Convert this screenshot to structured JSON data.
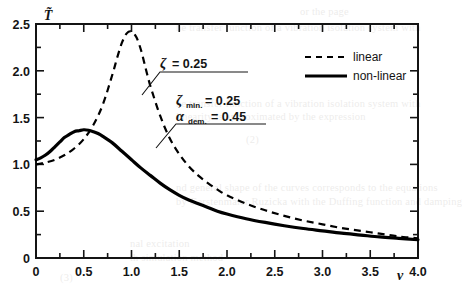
{
  "chart_data": {
    "type": "line",
    "title": "",
    "xlabel": "ν",
    "ylabel": "T̃",
    "xlim": [
      0,
      4.0
    ],
    "ylim": [
      0,
      2.5
    ],
    "grid": false,
    "x_ticks": [
      "0",
      "0.5",
      "1.0",
      "1.5",
      "2.0",
      "2.5",
      "3.0",
      "3.5",
      "4.0"
    ],
    "x_tick_values": [
      0,
      0.5,
      1.0,
      1.5,
      2.0,
      2.5,
      3.0,
      3.5,
      4.0
    ],
    "x_minor_step": 0.25,
    "y_ticks": [
      "0",
      "0.5",
      "1.0",
      "1.5",
      "2.0",
      "2.5"
    ],
    "y_tick_values": [
      0,
      0.5,
      1.0,
      1.5,
      2.0,
      2.5
    ],
    "y_minor_step": 0.25,
    "legend_position": "top-right inside",
    "series": [
      {
        "name": "linear",
        "style": "dashed",
        "color": "#000000",
        "x": [
          0.0,
          0.1,
          0.2,
          0.3,
          0.4,
          0.5,
          0.6,
          0.7,
          0.8,
          0.85,
          0.9,
          0.95,
          1.0,
          1.05,
          1.1,
          1.15,
          1.2,
          1.3,
          1.4,
          1.5,
          1.6,
          1.7,
          1.8,
          1.9,
          2.0,
          2.2,
          2.4,
          2.6,
          2.8,
          3.0,
          3.2,
          3.4,
          3.6,
          3.8,
          4.0
        ],
        "values": [
          1.0,
          1.02,
          1.05,
          1.1,
          1.17,
          1.27,
          1.42,
          1.64,
          1.96,
          2.14,
          2.3,
          2.4,
          2.42,
          2.36,
          2.22,
          2.02,
          1.83,
          1.52,
          1.28,
          1.11,
          0.98,
          0.88,
          0.8,
          0.73,
          0.67,
          0.58,
          0.51,
          0.45,
          0.4,
          0.36,
          0.32,
          0.29,
          0.26,
          0.23,
          0.21
        ]
      },
      {
        "name": "non-linear",
        "style": "solid",
        "color": "#000000",
        "x": [
          0.0,
          0.05,
          0.1,
          0.15,
          0.2,
          0.25,
          0.3,
          0.35,
          0.4,
          0.45,
          0.5,
          0.55,
          0.6,
          0.65,
          0.7,
          0.8,
          0.9,
          1.0,
          1.1,
          1.2,
          1.3,
          1.4,
          1.5,
          1.6,
          1.7,
          1.8,
          1.9,
          2.0,
          2.2,
          2.4,
          2.6,
          2.8,
          3.0,
          3.2,
          3.4,
          3.6,
          3.8,
          4.0
        ],
        "values": [
          1.05,
          1.07,
          1.1,
          1.14,
          1.19,
          1.24,
          1.29,
          1.32,
          1.35,
          1.36,
          1.37,
          1.365,
          1.35,
          1.33,
          1.3,
          1.23,
          1.14,
          1.05,
          0.96,
          0.88,
          0.8,
          0.73,
          0.67,
          0.62,
          0.58,
          0.54,
          0.5,
          0.47,
          0.42,
          0.38,
          0.345,
          0.315,
          0.29,
          0.265,
          0.245,
          0.225,
          0.21,
          0.195
        ]
      }
    ],
    "annotations": [
      {
        "id": "zeta-annotation",
        "symbol": "ζ",
        "subscript": "",
        "equals": "= 0.25",
        "full_text": "ζ = 0.25",
        "points_to_series": "linear"
      },
      {
        "id": "zeta-min-annotation",
        "symbol": "ζ",
        "subscript": "min.",
        "equals": "= 0.25",
        "full_text": "ζmin. = 0.25",
        "points_to_series": "non-linear"
      },
      {
        "id": "alpha-dem-annotation",
        "symbol": "α",
        "subscript": "dem.",
        "equals": "= 0.45",
        "full_text": "αdem. = 0.45",
        "points_to_series": "non-linear"
      }
    ],
    "legend": [
      {
        "label": "linear",
        "style": "dashed"
      },
      {
        "label": "non-linear",
        "style": "solid"
      }
    ]
  },
  "background_text": {
    "note": "faint show-through text from reverse page of scan",
    "lines": [
      "or the page",
      "he transfer function of a vibration isolation system with",
      "linearity is approximated by the expression",
      "(2)",
      "nd general shape of the curves corresponds to the equations",
      "by Gerstenmaier Ruzicka with the Duffing function and damping",
      "nal excitation",
      "th simulation method",
      "(3)"
    ]
  }
}
